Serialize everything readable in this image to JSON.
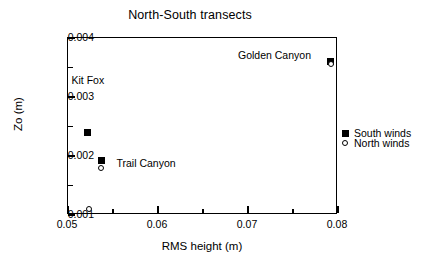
{
  "chart_data": {
    "type": "scatter",
    "title": "North-South transects",
    "xlabel": "RMS height (m)",
    "ylabel": "Zo (m)",
    "xlim": [
      0.05,
      0.08
    ],
    "ylim": [
      0.001,
      0.004
    ],
    "grid": false,
    "legend_position": "right-outside",
    "x_ticks": [
      {
        "value": 0.05,
        "label": "0.05",
        "major": true
      },
      {
        "value": 0.055,
        "label": "",
        "major": false
      },
      {
        "value": 0.06,
        "label": "0.06",
        "major": true
      },
      {
        "value": 0.065,
        "label": "",
        "major": false
      },
      {
        "value": 0.07,
        "label": "0.07",
        "major": true
      },
      {
        "value": 0.075,
        "label": "",
        "major": false
      },
      {
        "value": 0.08,
        "label": "0.08",
        "major": true
      }
    ],
    "y_ticks": [
      {
        "value": 0.001,
        "label": "0.001",
        "major": true
      },
      {
        "value": 0.0015,
        "label": "",
        "major": false
      },
      {
        "value": 0.002,
        "label": "0.002",
        "major": true
      },
      {
        "value": 0.0025,
        "label": "",
        "major": false
      },
      {
        "value": 0.003,
        "label": "0.003",
        "major": true
      },
      {
        "value": 0.0035,
        "label": "",
        "major": false
      },
      {
        "value": 0.004,
        "label": "0.004",
        "major": true
      }
    ],
    "series": [
      {
        "name": "South winds",
        "marker": "filled-square",
        "points": [
          {
            "x": 0.0523,
            "y": 0.00238,
            "site": "Kit Fox"
          },
          {
            "x": 0.0538,
            "y": 0.0019,
            "site": "Trail Canyon"
          },
          {
            "x": 0.0793,
            "y": 0.00358,
            "site": "Golden Canyon"
          }
        ]
      },
      {
        "name": "North winds",
        "marker": "open-circle",
        "points": [
          {
            "x": 0.0524,
            "y": 0.00108,
            "site": "Kit Fox"
          },
          {
            "x": 0.0538,
            "y": 0.00178,
            "site": "Trail Canyon"
          },
          {
            "x": 0.0793,
            "y": 0.00355,
            "site": "Golden Canyon"
          }
        ]
      }
    ],
    "annotations": [
      {
        "text": "Kit Fox",
        "x": 0.0505,
        "y": 0.00327
      },
      {
        "text": "Trail Canyon",
        "x": 0.0555,
        "y": 0.00186
      },
      {
        "text": "Golden Canyon",
        "x": 0.069,
        "y": 0.0037
      }
    ]
  },
  "legend": {
    "entries": [
      {
        "label": "South winds",
        "marker": "filled-square"
      },
      {
        "label": "North winds",
        "marker": "open-circle"
      }
    ]
  },
  "colors": {
    "foreground": "#000000",
    "background": "#ffffff"
  }
}
